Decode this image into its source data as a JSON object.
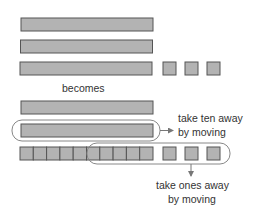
{
  "diagram": {
    "colors": {
      "block_fill": "#b3b3b3",
      "block_stroke": "#555555",
      "loop_stroke": "#888888",
      "text": "#333333"
    },
    "before": {
      "tens": 3,
      "ones": 3
    },
    "connector_label": "becomes",
    "after": {
      "tens": 2,
      "ones": 13,
      "ten_annotation": {
        "line1": "take ten away",
        "line2": "by moving"
      },
      "ones_annotation": {
        "line1": "take ones away",
        "line2": "by moving"
      }
    }
  }
}
